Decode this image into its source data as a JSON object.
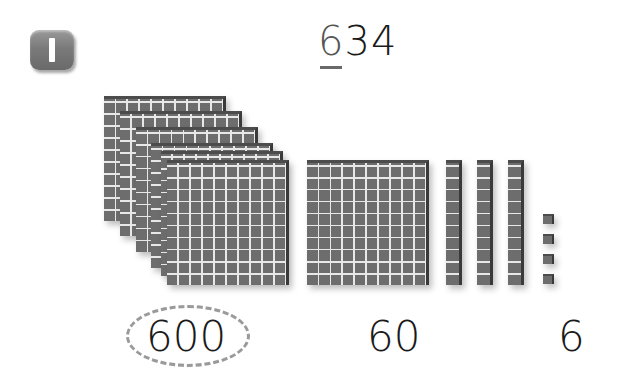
{
  "problem": {
    "number_badge": "1",
    "number": {
      "highlighted_digit": "6",
      "rest": "34",
      "full": "634"
    }
  },
  "blocks": {
    "hundreds": {
      "count": 6,
      "kind": "flat"
    },
    "tens_group": {
      "kind": "flat-like group of rods"
    },
    "tens_rods": {
      "count": 3,
      "kind": "rod"
    },
    "ones": {
      "count": 4,
      "kind": "unit"
    }
  },
  "labels": {
    "hundreds": "600",
    "tens": "60",
    "ones": "6"
  },
  "colors": {
    "block_fill": "#6d6d6d",
    "grid_line": "#e8e8e8",
    "badge": "#7a7a7a",
    "circle_dash": "#9a9a9a"
  }
}
